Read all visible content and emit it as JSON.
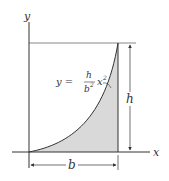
{
  "diagram": {
    "axis_x_label": "x",
    "axis_y_label": "y",
    "equation": {
      "lhs": "y =",
      "numerator": "h",
      "denominator": "b",
      "denominator_exponent": "2",
      "variable": "x",
      "variable_exponent": "2"
    },
    "dimension_height_label": "h",
    "dimension_base_label": "b",
    "colors": {
      "fill": "#d9d9d9",
      "stroke": "#333333"
    }
  }
}
